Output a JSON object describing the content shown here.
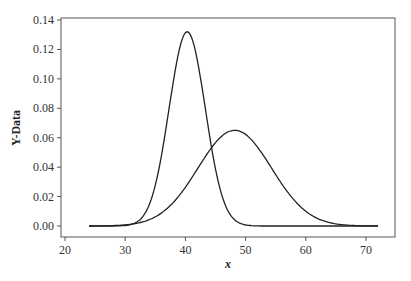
{
  "chart_data": {
    "type": "line",
    "title": "",
    "xlabel": "x",
    "ylabel": "Y-Data",
    "xlim": [
      20,
      72
    ],
    "ylim": [
      0,
      0.14
    ],
    "xticks": [
      "20",
      "30",
      "40",
      "50",
      "60",
      "70"
    ],
    "yticks": [
      "0.00",
      "0.02",
      "0.04",
      "0.06",
      "0.08",
      "0.10",
      "0.12",
      "0.14"
    ],
    "grid": false,
    "legend": null,
    "series": [
      {
        "name": "narrow",
        "mean": 40.3,
        "sd": 3.0,
        "peak": 0.132,
        "x": [
          24,
          30,
          33,
          35,
          37,
          38,
          39,
          40,
          40.4,
          41,
          42,
          43,
          44,
          45,
          46,
          47,
          48,
          50,
          55,
          60,
          65,
          72
        ],
        "y": [
          0.0,
          0.001,
          0.008,
          0.03,
          0.07,
          0.1,
          0.12,
          0.13,
          0.132,
          0.128,
          0.11,
          0.085,
          0.055,
          0.03,
          0.015,
          0.006,
          0.002,
          0.0,
          0.0,
          0.0,
          0.0,
          0.0
        ]
      },
      {
        "name": "wide",
        "mean": 48.2,
        "sd": 6.1,
        "peak": 0.065,
        "x": [
          24,
          30,
          33,
          36,
          39,
          42,
          45,
          48,
          48.2,
          51,
          54,
          57,
          60,
          63,
          66,
          69,
          72
        ],
        "y": [
          0.0,
          0.0,
          0.004,
          0.011,
          0.022,
          0.039,
          0.056,
          0.065,
          0.065,
          0.06,
          0.046,
          0.029,
          0.015,
          0.006,
          0.002,
          0.0,
          0.0
        ]
      }
    ]
  }
}
